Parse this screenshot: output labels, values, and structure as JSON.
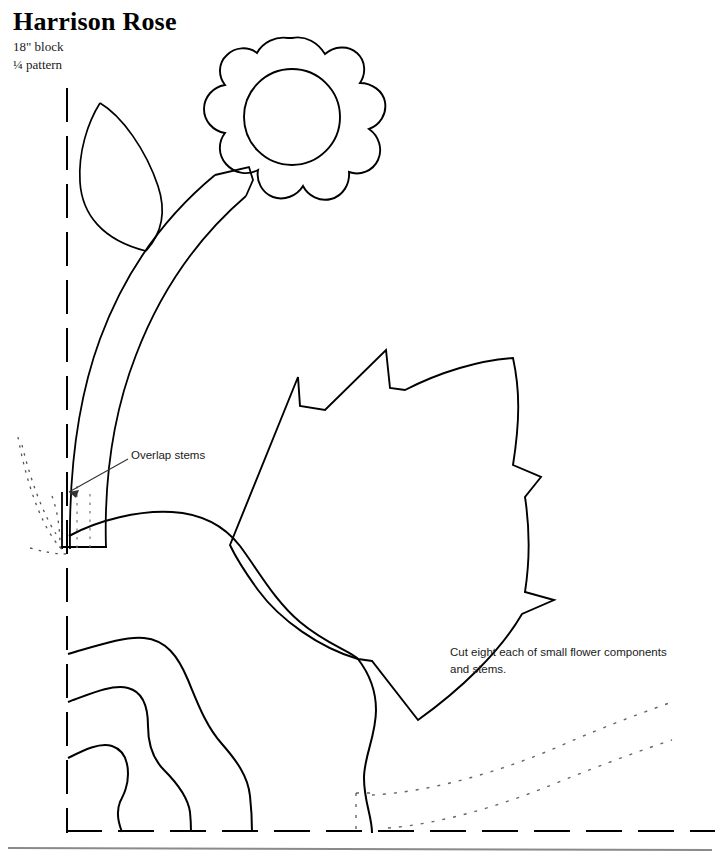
{
  "document": {
    "kind": "quilt-pattern-template",
    "background_color": "#ffffff",
    "ink_color": "#000000",
    "border_color": "#8a8a8a"
  },
  "header": {
    "title": "Harrison Rose",
    "subtitle_line1": "18\" block",
    "subtitle_line2": "¼ pattern"
  },
  "annotations": [
    {
      "id": "overlap-stems",
      "text": "Overlap stems",
      "x": 131,
      "y": 447,
      "leader_from": [
        128,
        459
      ],
      "leader_to": [
        68,
        492
      ]
    },
    {
      "id": "cut-eight",
      "text": "Cut eight each of small flower components\nand stems.",
      "x": 450,
      "y": 644
    }
  ],
  "guides": {
    "vertical_fold_line": {
      "x": 67,
      "y_start": 88,
      "y_end": 831,
      "style": "dashed"
    },
    "horizontal_base_line": {
      "y": 831,
      "x_start": 67,
      "x_end": 715,
      "style": "dashed"
    },
    "bottom_rule": {
      "y": 848,
      "x_start": 8,
      "x_end": 712,
      "style": "solid",
      "color": "#8a8a8a"
    }
  },
  "shapes": [
    {
      "name": "flower-head-scalloped",
      "type": "closed-wavy-circle",
      "cx": 292,
      "cy": 116,
      "r_outer": 78,
      "lobes": 9
    },
    {
      "name": "flower-head-inner-circle",
      "type": "circle",
      "cx": 292,
      "cy": 117,
      "r": 48
    },
    {
      "name": "leaf-upper-left",
      "type": "pointed-leaf",
      "tip_top": [
        100,
        103
      ],
      "tip_bottom": [
        146,
        251
      ]
    },
    {
      "name": "stem-curved-band",
      "type": "band",
      "from": [
        70,
        550
      ],
      "to": [
        250,
        175
      ]
    },
    {
      "name": "large-jagged-petal",
      "type": "polygon-leaf",
      "tips": 5
    },
    {
      "name": "mid-s-curve",
      "type": "open-curve",
      "from": [
        70,
        536
      ],
      "to": [
        372,
        830
      ]
    },
    {
      "name": "inner-wavy-curve-1",
      "type": "open-curve",
      "from": [
        68,
        653
      ],
      "to": [
        232,
        830
      ]
    },
    {
      "name": "inner-wavy-curve-2",
      "type": "open-curve",
      "from": [
        68,
        700
      ],
      "to": [
        190,
        830
      ]
    },
    {
      "name": "inner-wavy-curve-3",
      "type": "open-curve",
      "from": [
        68,
        757
      ],
      "to": [
        165,
        830
      ]
    },
    {
      "name": "dotted-hint-left",
      "type": "dotted-curve"
    },
    {
      "name": "dotted-hint-right-upper",
      "type": "dotted-curve",
      "from": [
        390,
        805
      ],
      "to": [
        672,
        718
      ]
    },
    {
      "name": "dotted-hint-right-lower",
      "type": "dotted-curve",
      "from": [
        455,
        832
      ],
      "to": [
        672,
        762
      ]
    }
  ]
}
